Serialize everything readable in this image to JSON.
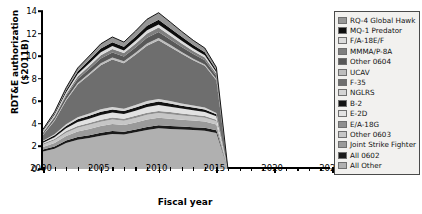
{
  "chart_data": {
    "type": "area",
    "stacked": true,
    "title": "",
    "xlabel": "Fiscal year",
    "ylabel": "RDT&E authorization ($2011B)",
    "xlim": [
      2000,
      2025
    ],
    "ylim": [
      0,
      14
    ],
    "yticks": [
      0,
      2,
      4,
      6,
      8,
      10,
      12,
      14
    ],
    "xticks": [
      2000,
      2005,
      2010,
      2015,
      2020,
      2025
    ],
    "xtick_labels": [
      "2000",
      "2005",
      "2010",
      "2015",
      "2020",
      "2025"
    ],
    "minor_xticks_interval": 1,
    "grid": false,
    "legend_position": "right-outside",
    "x": [
      2000,
      2001,
      2002,
      2003,
      2004,
      2005,
      2006,
      2007,
      2008,
      2009,
      2010,
      2011,
      2012,
      2013,
      2014,
      2015,
      2016,
      2017,
      2018,
      2019,
      2020,
      2021,
      2022,
      2023,
      2024,
      2025
    ],
    "series": [
      {
        "name": "All Other",
        "color": "#b0b0b0",
        "values": [
          1.55,
          1.8,
          2.3,
          2.6,
          2.75,
          2.95,
          3.1,
          3.05,
          3.25,
          3.45,
          3.6,
          3.55,
          3.5,
          3.45,
          3.4,
          3.2,
          0,
          0,
          0,
          0,
          0,
          0,
          0,
          0,
          0,
          0
        ]
      },
      {
        "name": "All 0602",
        "color": "#1a1a1a",
        "values": [
          0.18,
          0.2,
          0.22,
          0.24,
          0.25,
          0.26,
          0.26,
          0.25,
          0.26,
          0.28,
          0.28,
          0.27,
          0.26,
          0.26,
          0.25,
          0.24,
          0,
          0,
          0,
          0,
          0,
          0,
          0,
          0,
          0,
          0
        ]
      },
      {
        "name": "Joint Strike Fighter",
        "color": "#9a9a9a",
        "values": [
          0.22,
          0.3,
          0.4,
          0.48,
          0.55,
          0.6,
          0.62,
          0.6,
          0.62,
          0.65,
          0.66,
          0.64,
          0.6,
          0.58,
          0.55,
          0.5,
          0,
          0,
          0,
          0,
          0,
          0,
          0,
          0,
          0,
          0
        ]
      },
      {
        "name": "Other 0603",
        "color": "#c6c6c6",
        "values": [
          0.2,
          0.24,
          0.3,
          0.34,
          0.36,
          0.38,
          0.4,
          0.38,
          0.4,
          0.42,
          0.42,
          0.4,
          0.38,
          0.36,
          0.35,
          0.3,
          0,
          0,
          0,
          0,
          0,
          0,
          0,
          0,
          0,
          0
        ]
      },
      {
        "name": "E/A-18G",
        "color": "#8f8f8f",
        "values": [
          0.1,
          0.12,
          0.14,
          0.16,
          0.17,
          0.18,
          0.18,
          0.17,
          0.18,
          0.19,
          0.19,
          0.18,
          0.17,
          0.16,
          0.15,
          0.13,
          0,
          0,
          0,
          0,
          0,
          0,
          0,
          0,
          0,
          0
        ]
      },
      {
        "name": "E-2D",
        "color": "#e2e2e2",
        "values": [
          0.08,
          0.16,
          0.26,
          0.34,
          0.38,
          0.42,
          0.44,
          0.42,
          0.46,
          0.5,
          0.52,
          0.48,
          0.44,
          0.4,
          0.36,
          0.3,
          0,
          0,
          0,
          0,
          0,
          0,
          0,
          0,
          0,
          0
        ]
      },
      {
        "name": "B-2",
        "color": "#121212",
        "values": [
          0.12,
          0.16,
          0.2,
          0.24,
          0.26,
          0.28,
          0.28,
          0.26,
          0.28,
          0.3,
          0.3,
          0.28,
          0.26,
          0.24,
          0.22,
          0.18,
          0,
          0,
          0,
          0,
          0,
          0,
          0,
          0,
          0,
          0
        ]
      },
      {
        "name": "NGLRS",
        "color": "#d4d4d4",
        "values": [
          0.06,
          0.1,
          0.14,
          0.18,
          0.2,
          0.22,
          0.22,
          0.2,
          0.22,
          0.24,
          0.24,
          0.22,
          0.2,
          0.18,
          0.16,
          0.12,
          0,
          0,
          0,
          0,
          0,
          0,
          0,
          0,
          0,
          0
        ]
      },
      {
        "name": "F-35",
        "color": "#6e6e6e",
        "values": [
          0.5,
          1.2,
          2.1,
          2.9,
          3.4,
          3.9,
          4.2,
          4.05,
          4.45,
          4.9,
          5.2,
          4.8,
          4.4,
          4.0,
          3.7,
          2.9,
          0,
          0,
          0,
          0,
          0,
          0,
          0,
          0,
          0,
          0
        ]
      },
      {
        "name": "UCAV",
        "color": "#bdbdbd",
        "values": [
          0.05,
          0.08,
          0.12,
          0.15,
          0.17,
          0.18,
          0.18,
          0.17,
          0.18,
          0.2,
          0.2,
          0.18,
          0.16,
          0.15,
          0.13,
          0.1,
          0,
          0,
          0,
          0,
          0,
          0,
          0,
          0,
          0,
          0
        ]
      },
      {
        "name": "Other 0604",
        "color": "#585858",
        "values": [
          0.14,
          0.2,
          0.28,
          0.34,
          0.38,
          0.42,
          0.44,
          0.42,
          0.46,
          0.5,
          0.52,
          0.48,
          0.44,
          0.4,
          0.36,
          0.28,
          0,
          0,
          0,
          0,
          0,
          0,
          0,
          0,
          0,
          0
        ]
      },
      {
        "name": "MMMA/P-8A",
        "color": "#7e7e7e",
        "values": [
          0.06,
          0.1,
          0.16,
          0.22,
          0.26,
          0.3,
          0.32,
          0.3,
          0.34,
          0.38,
          0.4,
          0.36,
          0.32,
          0.28,
          0.25,
          0.18,
          0,
          0,
          0,
          0,
          0,
          0,
          0,
          0,
          0,
          0
        ]
      },
      {
        "name": "F/A-18E/F",
        "color": "#dcdcdc",
        "values": [
          0.1,
          0.14,
          0.18,
          0.22,
          0.24,
          0.26,
          0.26,
          0.24,
          0.26,
          0.28,
          0.28,
          0.26,
          0.24,
          0.22,
          0.2,
          0.14,
          0,
          0,
          0,
          0,
          0,
          0,
          0,
          0,
          0,
          0
        ]
      },
      {
        "name": "MQ-1 Predator",
        "color": "#0d0d0d",
        "values": [
          0.08,
          0.12,
          0.18,
          0.24,
          0.28,
          0.32,
          0.34,
          0.32,
          0.36,
          0.4,
          0.42,
          0.38,
          0.34,
          0.3,
          0.26,
          0.18,
          0,
          0,
          0,
          0,
          0,
          0,
          0,
          0,
          0,
          0
        ]
      },
      {
        "name": "RQ-4 Global Hawk",
        "color": "#969696",
        "values": [
          0.08,
          0.14,
          0.22,
          0.3,
          0.36,
          0.42,
          0.46,
          0.42,
          0.5,
          0.58,
          0.62,
          0.55,
          0.48,
          0.42,
          0.38,
          0.26,
          0,
          0,
          0,
          0,
          0,
          0,
          0,
          0,
          0,
          0
        ]
      }
    ]
  },
  "legend": {
    "items": [
      {
        "label": "RQ-4 Global Hawk",
        "color": "#969696"
      },
      {
        "label": "MQ-1 Predator",
        "color": "#0d0d0d"
      },
      {
        "label": "F/A-18E/F",
        "color": "#dcdcdc"
      },
      {
        "label": "MMMA/P-8A",
        "color": "#7e7e7e"
      },
      {
        "label": "Other 0604",
        "color": "#585858"
      },
      {
        "label": "UCAV",
        "color": "#bdbdbd"
      },
      {
        "label": "F-35",
        "color": "#6e6e6e"
      },
      {
        "label": "NGLRS",
        "color": "#d4d4d4"
      },
      {
        "label": "B-2",
        "color": "#121212"
      },
      {
        "label": "E-2D",
        "color": "#e2e2e2"
      },
      {
        "label": "E/A-18G",
        "color": "#8f8f8f"
      },
      {
        "label": "Other 0603",
        "color": "#c6c6c6"
      },
      {
        "label": "Joint Strike Fighter",
        "color": "#9a9a9a"
      },
      {
        "label": "All 0602",
        "color": "#1a1a1a"
      },
      {
        "label": "All Other",
        "color": "#b0b0b0"
      }
    ]
  },
  "axes": {
    "ylabel": "RDT&E authorization ($2011B)",
    "xlabel": "Fiscal year"
  }
}
